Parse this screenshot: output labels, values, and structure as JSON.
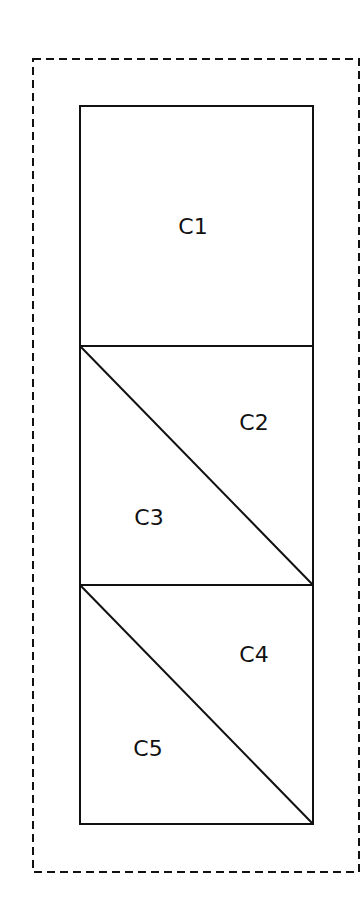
{
  "diagram": {
    "title": "",
    "colors": {
      "stroke": "#111111",
      "background": "#ffffff"
    },
    "boundary": {
      "style": "dashed",
      "x": 33,
      "y": 59,
      "width": 326,
      "height": 813
    },
    "container": {
      "x": 80,
      "y": 106,
      "width": 233,
      "height": 718
    },
    "dividers": [
      {
        "type": "horizontal",
        "y": 346
      },
      {
        "type": "horizontal",
        "y": 585
      },
      {
        "type": "diagonal",
        "from": [
          80,
          346
        ],
        "to": [
          313,
          585
        ]
      },
      {
        "type": "diagonal",
        "from": [
          80,
          585
        ],
        "to": [
          313,
          824
        ]
      }
    ],
    "cells": [
      {
        "id": "C1",
        "label": "C1",
        "x": 193,
        "y": 234
      },
      {
        "id": "C2",
        "label": "C2",
        "x": 254,
        "y": 430
      },
      {
        "id": "C3",
        "label": "C3",
        "x": 149,
        "y": 525
      },
      {
        "id": "C4",
        "label": "C4",
        "x": 254,
        "y": 662
      },
      {
        "id": "C5",
        "label": "C5",
        "x": 148,
        "y": 756
      }
    ]
  }
}
